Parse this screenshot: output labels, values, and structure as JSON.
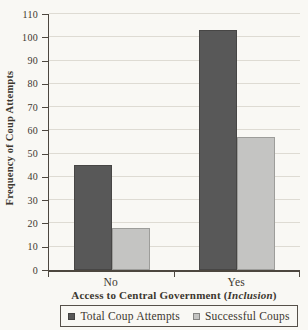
{
  "chart_data": {
    "type": "bar",
    "title": "",
    "categories": [
      "No",
      "Yes"
    ],
    "series": [
      {
        "name": "Total Coup Attempts",
        "values": [
          45,
          103
        ],
        "color": "#585858"
      },
      {
        "name": "Successful Coups",
        "values": [
          18,
          57
        ],
        "color": "#c4c4c2"
      }
    ],
    "ylabel": "Frequency of Coup Attempts",
    "xlabel_prefix": "Access to Central Government (",
    "xlabel_italic": "Inclusion",
    "xlabel_suffix": ")",
    "ylim": [
      0,
      110
    ],
    "yticks": [
      0,
      10,
      20,
      30,
      40,
      50,
      60,
      70,
      80,
      90,
      100,
      110
    ],
    "grid": "horizontal",
    "legend_position": "bottom-boxed"
  },
  "colors": {
    "paper": "#f9f8f4",
    "text": "#3c372f",
    "axis": "#4d473f",
    "gridline": "#dedbd3",
    "legend_border": "#565049"
  }
}
